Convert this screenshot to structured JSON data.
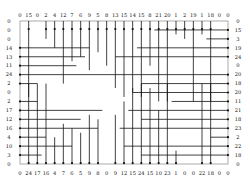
{
  "puzzle": {
    "columns": 25,
    "rows": 17,
    "top_labels": [
      0,
      15,
      0,
      2,
      4,
      12,
      7,
      6,
      9,
      5,
      8,
      13,
      15,
      14,
      15,
      8,
      21,
      20,
      1,
      2,
      19,
      1,
      18,
      0,
      0
    ],
    "bottom_labels": [
      0,
      24,
      17,
      16,
      4,
      7,
      6,
      5,
      9,
      8,
      0,
      9,
      12,
      15,
      24,
      15,
      10,
      23,
      1,
      0,
      0,
      22,
      18,
      0,
      0
    ],
    "left_labels": [
      0,
      0,
      0,
      14,
      13,
      11,
      24,
      2,
      0,
      2,
      17,
      12,
      16,
      4,
      10,
      3,
      0
    ],
    "right_labels": [
      0,
      15,
      3,
      19,
      24,
      0,
      20,
      18,
      20,
      11,
      21,
      18,
      23,
      2,
      22,
      18,
      0
    ],
    "line_color": "#111111",
    "border_color": "#888888",
    "background": "#ffffff"
  }
}
